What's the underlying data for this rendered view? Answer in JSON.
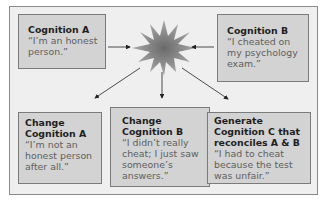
{
  "diagram": {
    "type": "cognitive-dissonance-flow",
    "center_symbol": "starburst (dissonance)",
    "colors": {
      "frame_bg": "#efefef",
      "frame_border": "#8a8a8a",
      "box_bg": "#d3d3d3",
      "box_border": "#7b7b7b",
      "title_text": "#1e1e1e",
      "quote_text": "#606060",
      "star_outer": "#9a9a9a",
      "star_inner": "#6e6e6e",
      "arrow": "#222222"
    },
    "inputs": [
      {
        "title": "Cognition A",
        "quote": "“I’m an honest person.”"
      },
      {
        "title": "Cognition B",
        "quote": "“I cheated on my psychology exam.”"
      }
    ],
    "outcomes": [
      {
        "title": "Change Cognition A",
        "quote": "“I’m not an honest person after all.”"
      },
      {
        "title": "Change Cognition B",
        "quote": "“I didn’t really cheat; I just saw someone’s answers.”"
      },
      {
        "title": "Generate Cognition C that reconciles A & B",
        "quote": "“I had to cheat because the test was unfair.”"
      }
    ]
  }
}
